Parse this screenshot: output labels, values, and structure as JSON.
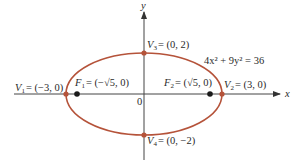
{
  "diagram": {
    "type": "ellipse",
    "equation": "4x² + 9y² = 36",
    "colors": {
      "curve": "#b5533a",
      "vertex": "#b5533a",
      "focus": "#1a1a1a",
      "axis": "#333333",
      "text": "#2a2a2a",
      "background": "#ffffff"
    },
    "axes": {
      "x_label": "x",
      "y_label": "y",
      "origin_label": "0"
    },
    "vertices": [
      {
        "id": "V1",
        "name": "V",
        "sub": "1",
        "coords": "= (−3, 0)",
        "x": -3,
        "y": 0
      },
      {
        "id": "V2",
        "name": "V",
        "sub": "2",
        "coords": "= (3, 0)",
        "x": 3,
        "y": 0
      },
      {
        "id": "V3",
        "name": "V",
        "sub": "3",
        "coords": "= (0, 2)",
        "x": 0,
        "y": 2
      },
      {
        "id": "V4",
        "name": "V",
        "sub": "4",
        "coords": "= (0, −2)",
        "x": 0,
        "y": -2
      }
    ],
    "foci": [
      {
        "id": "F1",
        "name": "F",
        "sub": "1",
        "coords": "= (−√5, 0)"
      },
      {
        "id": "F2",
        "name": "F",
        "sub": "2",
        "coords": "= (√5, 0)"
      }
    ]
  }
}
